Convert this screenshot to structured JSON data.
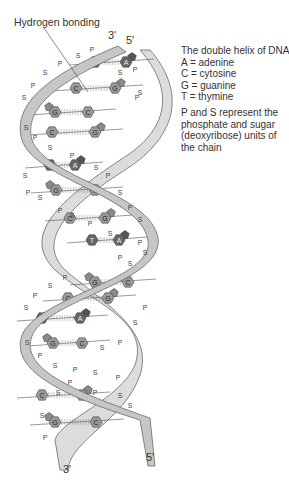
{
  "labels": {
    "hydrogen_bonding": "Hydrogen bonding",
    "top_3prime": "3'",
    "top_5prime": "5'",
    "bottom_3prime": "3'",
    "bottom_5prime": "5'"
  },
  "legend": {
    "title": "The double helix of DNA",
    "items": [
      {
        "code": "A",
        "text": "A = adenine"
      },
      {
        "code": "C",
        "text": "C = cytosine"
      },
      {
        "code": "G",
        "text": "G = guanine"
      },
      {
        "code": "T",
        "text": "T = thymine"
      }
    ]
  },
  "note": {
    "lines": [
      "P and S represent the",
      "phosphate and sugar",
      "(deoxyribose) units of",
      "the chain"
    ]
  },
  "backbone_labels": {
    "phosphate": "P",
    "sugar": "S"
  },
  "base_pairs": [
    {
      "left": "T",
      "right": "A"
    },
    {
      "left": "C",
      "right": "G"
    },
    {
      "left": "G",
      "right": "C"
    },
    {
      "left": "C",
      "right": "G"
    },
    {
      "left": "T",
      "right": "A"
    },
    {
      "left": "G",
      "right": "C"
    },
    {
      "left": "C",
      "right": "G"
    },
    {
      "left": "T",
      "right": "A"
    },
    {
      "left": "G",
      "right": "C"
    },
    {
      "left": "C",
      "right": "G"
    },
    {
      "left": "T",
      "right": "A"
    },
    {
      "left": "G",
      "right": "C"
    },
    {
      "left": "C",
      "right": "G"
    },
    {
      "left": "G",
      "right": "C"
    }
  ],
  "colors": {
    "ribbon_fill": "#c8c8c8",
    "ribbon_back": "#dedede",
    "ribbon_stroke": "#6a6a6a",
    "base_light": "#9a9a9a",
    "base_dark": "#666666",
    "text": "#333333"
  }
}
